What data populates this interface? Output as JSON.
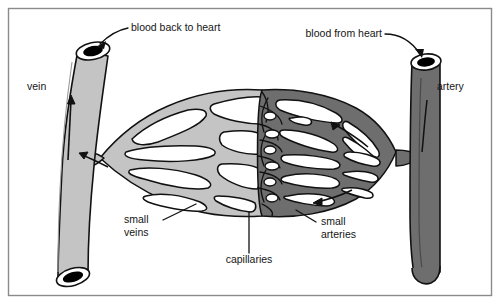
{
  "figure": {
    "frame": {
      "stroke": "#8a8a8a",
      "inset": 8
    },
    "background": "#ffffff"
  },
  "colors": {
    "vein_fill": "#bfbfbf",
    "vein_fill_light": "#cccccc",
    "artery_fill": "#6e6e6e",
    "artery_fill_dark": "#5f5f5f",
    "lumen": "#000000",
    "outline": "#111111",
    "label_text": "#151515",
    "frame_stroke": "#8a8a8a"
  },
  "labels": {
    "blood_back_to_heart": "blood back to heart",
    "blood_from_heart": "blood from heart",
    "vein": "vein",
    "artery": "artery",
    "small_veins_line1": "small",
    "small_veins_line2": "veins",
    "small_arteries_line1": "small",
    "small_arteries_line2": "arteries",
    "capillaries": "capillaries"
  },
  "structures": [
    {
      "name": "vein",
      "side": "left",
      "shade": "light",
      "flow": "toward heart"
    },
    {
      "name": "artery",
      "side": "right",
      "shade": "dark",
      "flow": "from heart"
    },
    {
      "name": "small-veins",
      "side": "left-network",
      "shade": "light"
    },
    {
      "name": "capillaries",
      "side": "center",
      "shade": "mixed"
    },
    {
      "name": "small-arteries",
      "side": "right-network",
      "shade": "dark"
    }
  ],
  "flow_arrows": [
    {
      "name": "vein-upward-arrow",
      "direction": "up",
      "vessel": "vein"
    },
    {
      "name": "vein-junction-arrow",
      "direction": "up-left",
      "vessel": "vein"
    },
    {
      "name": "artery-junction-arrow",
      "direction": "left",
      "vessel": "artery"
    },
    {
      "name": "artery-branch-arrow",
      "direction": "left-down",
      "vessel": "artery"
    }
  ]
}
